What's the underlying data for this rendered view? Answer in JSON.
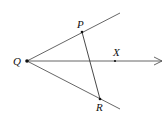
{
  "diagram": {
    "type": "geometry",
    "points": {
      "Q": {
        "label": "Q",
        "x": 27,
        "y": 61
      },
      "P": {
        "label": "P",
        "x": 82,
        "y": 32
      },
      "R": {
        "label": "R",
        "x": 100,
        "y": 99
      },
      "X": {
        "label": "X",
        "x": 115,
        "y": 61
      }
    },
    "rays": [
      {
        "name": "ray-QP",
        "from": "Q",
        "to_x": 120,
        "to_y": 13
      },
      {
        "name": "ray-QR",
        "from": "Q",
        "to_x": 120,
        "to_y": 109
      },
      {
        "name": "ray-QX",
        "from": "Q",
        "to_x": 162,
        "to_y": 61,
        "arrow": true
      }
    ],
    "segments": [
      {
        "name": "segment-PR",
        "from": "P",
        "to": "R"
      }
    ],
    "colors": {
      "line": "#555555",
      "point": "#111111"
    }
  }
}
